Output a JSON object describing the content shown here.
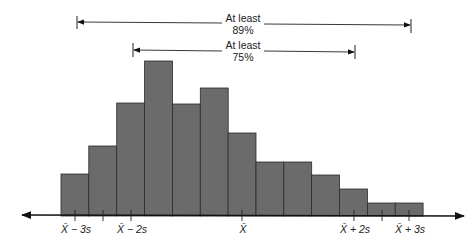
{
  "chart_data": {
    "type": "bar",
    "title": "",
    "xlabel": "",
    "ylabel": "",
    "grid": false,
    "bar_color": "#6b6b6b",
    "bar_edge_color": "#2a2a2a",
    "categories": [
      "1",
      "2",
      "3",
      "4",
      "5",
      "6",
      "7",
      "8",
      "9",
      "10",
      "11",
      "12",
      "13"
    ],
    "values": [
      42,
      70,
      113,
      155,
      112,
      128,
      83,
      54,
      54,
      41,
      27,
      13,
      13
    ],
    "ylim": [
      0,
      160
    ],
    "tick_labels": [
      {
        "text": "X̄ − 3s",
        "pos": 75
      },
      {
        "text": "X̄ − 2s",
        "pos": 131
      },
      {
        "text": "X̄",
        "pos": 242
      },
      {
        "text": "X̄ + 2s",
        "pos": 354
      },
      {
        "text": "X̄ + 3s",
        "pos": 409
      }
    ],
    "minor_ticks": [
      103,
      382
    ],
    "annotations": [
      {
        "line1": "At least",
        "line2": "89%",
        "from": "X̄ − 3s",
        "to": "X̄ + 3s"
      },
      {
        "line1": "At least",
        "line2": "75%",
        "from": "X̄ − 2s",
        "to": "X̄ + 2s"
      }
    ]
  }
}
